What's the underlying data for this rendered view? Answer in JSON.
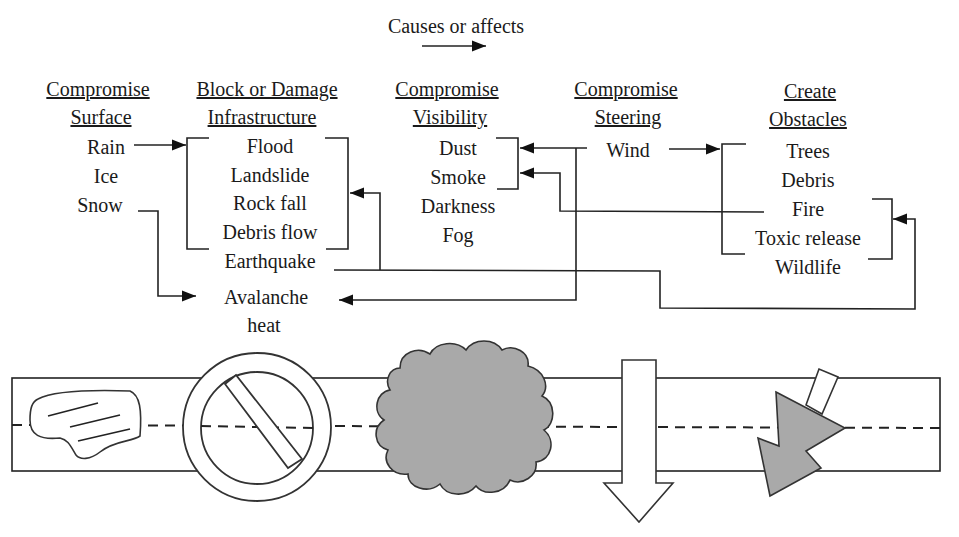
{
  "legend": {
    "label": "Causes or affects",
    "symbol": "arrow-right"
  },
  "categories": [
    {
      "id": "surface",
      "header_line1": "Compromise",
      "header_line2": "Surface",
      "items": [
        "Rain",
        "Ice",
        "Snow"
      ]
    },
    {
      "id": "infrastructure",
      "header_line1": "Block  or Damage",
      "header_line2": "Infrastructure",
      "items": [
        "Flood",
        "Landslide",
        "Rock fall",
        "Debris flow",
        "Earthquake",
        "Avalanche",
        "heat"
      ]
    },
    {
      "id": "visibility",
      "header_line1": "Compromise",
      "header_line2": "Visibility",
      "items": [
        "Dust",
        "Smoke",
        "Darkness",
        "Fog"
      ]
    },
    {
      "id": "steering",
      "header_line1": "Compromise",
      "header_line2": "Steering",
      "items": [
        "Wind"
      ]
    },
    {
      "id": "obstacles",
      "header_line1": "Create",
      "header_line2": "Obstacles",
      "items": [
        "Trees",
        "Debris",
        "Fire",
        "Toxic release",
        "Wildlife"
      ]
    }
  ],
  "relations": [
    {
      "from": "Rain",
      "to": "Flood / Landslide / Rock fall / Debris flow"
    },
    {
      "from": "Snow",
      "to": "Avalanche"
    },
    {
      "from": "Earthquake",
      "to": "Flood / Landslide / Rock fall / Debris flow"
    },
    {
      "from": "Earthquake",
      "to": "Fire / Toxic release"
    },
    {
      "from": "Wind",
      "to": "Dust / Smoke"
    },
    {
      "from": "Wind",
      "to": "Avalanche"
    },
    {
      "from": "Wind",
      "to": "Trees / Debris / Fire / Toxic release"
    },
    {
      "from": "Fire",
      "to": "Smoke"
    }
  ],
  "road_icons": [
    {
      "name": "ice-patch-icon",
      "category": "surface"
    },
    {
      "name": "no-entry-icon",
      "category": "infrastructure"
    },
    {
      "name": "cloud-icon",
      "category": "visibility"
    },
    {
      "name": "down-arrow-icon",
      "category": "steering"
    },
    {
      "name": "fallen-tree-icon",
      "category": "obstacles"
    }
  ]
}
